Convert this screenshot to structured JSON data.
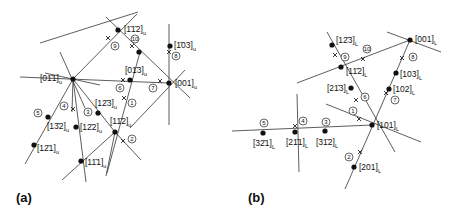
{
  "panels": {
    "a": {
      "label": "(a)",
      "subscript": "u",
      "poles": [
        {
          "id": "m112",
          "text": "[1̄1̄2]",
          "x": 118,
          "y": 30
        },
        {
          "id": "m103",
          "text": "[1̄03]",
          "x": 170,
          "y": 46
        },
        {
          "id": "0m13",
          "text": "[01̄3]",
          "x": 130,
          "y": 80
        },
        {
          "id": "0m11",
          "text": "[01̄1]",
          "x": 73,
          "y": 79
        },
        {
          "id": "001",
          "text": "[001]",
          "x": 169,
          "y": 83
        },
        {
          "id": "1m23",
          "text": "[12̄3]",
          "x": 98,
          "y": 113
        },
        {
          "id": "1m12",
          "text": "[11̄2]",
          "x": 115,
          "y": 132
        },
        {
          "id": "1m32",
          "text": "[13̄2]",
          "x": 48,
          "y": 117
        },
        {
          "id": "1m22",
          "text": "[12̄2]",
          "x": 76,
          "y": 127
        },
        {
          "id": "1m21",
          "text": "[12̄1]",
          "x": 34,
          "y": 145
        },
        {
          "id": "1m11",
          "text": "[11̄1]",
          "x": 81,
          "y": 161
        }
      ],
      "markers": [
        "1",
        "2",
        "3",
        "4",
        "5",
        "6",
        "7",
        "8",
        "9",
        "10"
      ]
    },
    "b": {
      "label": "(b)",
      "subscript": "L",
      "poles": [
        {
          "id": "1m23",
          "text": "[12̄3]",
          "x": 332,
          "y": 45
        },
        {
          "id": "001",
          "text": "[001]",
          "x": 410,
          "y": 40
        },
        {
          "id": "1m12",
          "text": "[11̄2]",
          "x": 341,
          "y": 67
        },
        {
          "id": "103",
          "text": "[103]",
          "x": 396,
          "y": 73
        },
        {
          "id": "2m13",
          "text": "[21̄3]",
          "x": 351,
          "y": 88
        },
        {
          "id": "102",
          "text": "[102]",
          "x": 389,
          "y": 89
        },
        {
          "id": "101",
          "text": "[101]",
          "x": 372,
          "y": 125
        },
        {
          "id": "3m21",
          "text": "[32̄1]",
          "x": 263,
          "y": 133
        },
        {
          "id": "2m11",
          "text": "[21̄1]",
          "x": 295,
          "y": 132
        },
        {
          "id": "3m12",
          "text": "[31̄2]",
          "x": 325,
          "y": 131
        },
        {
          "id": "201",
          "text": "[201]",
          "x": 354,
          "y": 167
        }
      ],
      "markers": [
        "2",
        "3",
        "4",
        "5",
        "6",
        "7",
        "8",
        "9",
        "10"
      ]
    }
  }
}
